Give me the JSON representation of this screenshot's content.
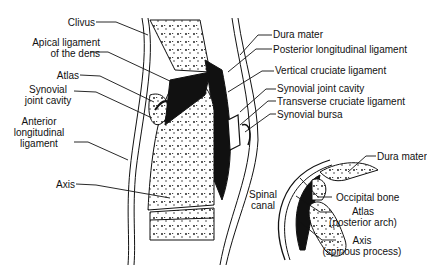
{
  "figure": {
    "main_view": {
      "left_labels": [
        {
          "id": "clivus",
          "text": "Clivus"
        },
        {
          "id": "apical",
          "line1": "Apical ligament",
          "line2": "of the dens"
        },
        {
          "id": "atlas",
          "text": "Atlas"
        },
        {
          "id": "synovial-left",
          "line1": "Synovial",
          "line2": "joint cavity"
        },
        {
          "id": "anterior",
          "line1": "Anterior",
          "line2": "longitudinal",
          "line3": "ligament"
        },
        {
          "id": "axis",
          "text": "Axis"
        }
      ],
      "right_labels": [
        {
          "id": "dura",
          "text": "Dura mater"
        },
        {
          "id": "posterior",
          "text": "Posterior longitudinal ligament"
        },
        {
          "id": "vertical",
          "text": "Vertical cruciate ligament"
        },
        {
          "id": "synovial-right",
          "text": "Synovial joint cavity"
        },
        {
          "id": "transverse",
          "text": "Transverse cruciate ligament"
        },
        {
          "id": "bursa",
          "text": "Synovial bursa"
        }
      ],
      "center_label": {
        "line1": "Spinal",
        "line2": "canal"
      }
    },
    "inset_view": {
      "labels": [
        {
          "id": "dura2",
          "text": "Dura mater"
        },
        {
          "id": "occipital",
          "text": "Occipital bone"
        },
        {
          "id": "atlas2",
          "line1": "Atlas",
          "line2": "(posterior arch)"
        },
        {
          "id": "axis2",
          "line1": "Axis",
          "line2": "(spinous process)"
        }
      ]
    }
  }
}
